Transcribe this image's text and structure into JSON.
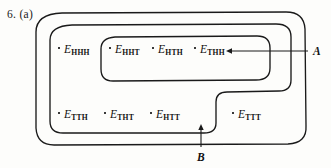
{
  "figure": {
    "number": "6. (a)",
    "background_color": "#fdfdfb",
    "ink_color": "#1a1a1a"
  },
  "outcomes": [
    {
      "name": "E-HHH",
      "base": "E",
      "subscript": "HHH",
      "x": 64,
      "y": 44,
      "region": "S-only"
    },
    {
      "name": "E-HHT",
      "base": "E",
      "subscript": "HHT",
      "x": 115,
      "y": 44,
      "region": "A"
    },
    {
      "name": "E-HTH",
      "base": "E",
      "subscript": "HTH",
      "x": 158,
      "y": 44,
      "region": "A"
    },
    {
      "name": "E-THH",
      "base": "E",
      "subscript": "THH",
      "x": 200,
      "y": 44,
      "region": "A"
    },
    {
      "name": "E-TTH",
      "base": "E",
      "subscript": "TTH",
      "x": 64,
      "y": 109,
      "region": "B"
    },
    {
      "name": "E-THT",
      "base": "E",
      "subscript": "THT",
      "x": 110,
      "y": 109,
      "region": "B"
    },
    {
      "name": "E-HTT",
      "base": "E",
      "subscript": "HTT",
      "x": 156,
      "y": 109,
      "region": "B"
    },
    {
      "name": "E-TTT",
      "base": "E",
      "subscript": "TTT",
      "x": 238,
      "y": 109,
      "region": "S-only"
    }
  ],
  "set_labels": [
    {
      "name": "A",
      "text": "A",
      "x": 313,
      "y": 45
    },
    {
      "name": "B",
      "text": "B",
      "x": 197,
      "y": 151
    }
  ],
  "annotations": {
    "a_leader": {
      "from_x": 308,
      "from_y": 51,
      "to_x": 226,
      "to_y": 51,
      "direction": "left"
    },
    "b_leader": {
      "from_x": 201,
      "from_y": 148,
      "to_x": 201,
      "to_y": 124,
      "direction": "up"
    }
  }
}
